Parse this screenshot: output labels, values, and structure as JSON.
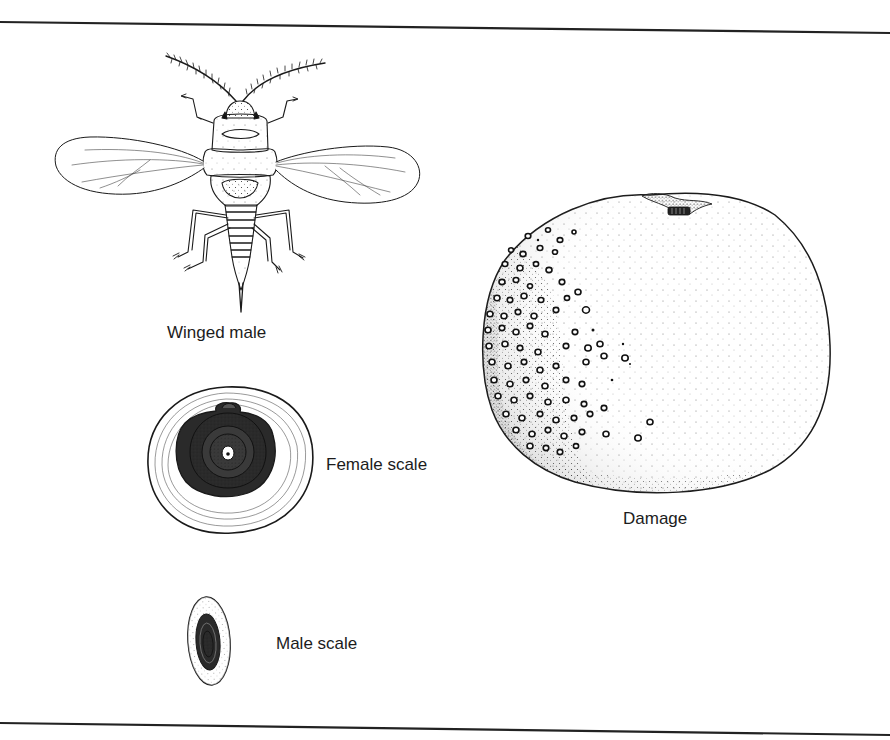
{
  "figure": {
    "panels": [
      {
        "id": "winged-male",
        "label": "Winged male"
      },
      {
        "id": "female-scale",
        "label": "Female scale"
      },
      {
        "id": "male-scale",
        "label": "Male scale"
      },
      {
        "id": "damage",
        "label": "Damage"
      }
    ]
  },
  "colors": {
    "ink": "#1a1a1a",
    "paper": "#ffffff",
    "rule": "#222222"
  }
}
